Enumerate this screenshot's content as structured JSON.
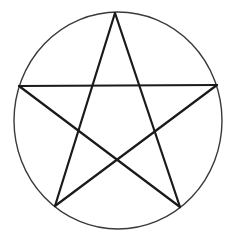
{
  "diagram": {
    "title": "Pentagram inscribed in a circle",
    "colors": {
      "background": "#ffffff",
      "circle_stroke": "#3a3a3a",
      "star_stroke": "#1a1a1a"
    },
    "circle": {
      "cx": 118,
      "cy": 120.5,
      "rx": 104,
      "ry": 108.5,
      "stroke_width": 1.4
    },
    "star": {
      "stroke_width": 2.2,
      "vertices": {
        "top": [
          115,
          13
        ],
        "left": [
          19,
          86
        ],
        "right": [
          217,
          85
        ],
        "bottom_left": [
          55,
          206
        ],
        "bottom_right": [
          180,
          207
        ]
      },
      "segments": [
        [
          "top",
          "bottom_left"
        ],
        [
          "top",
          "bottom_right"
        ],
        [
          "left",
          "right"
        ],
        [
          "left",
          "bottom_right"
        ],
        [
          "right",
          "bottom_left"
        ]
      ]
    }
  }
}
